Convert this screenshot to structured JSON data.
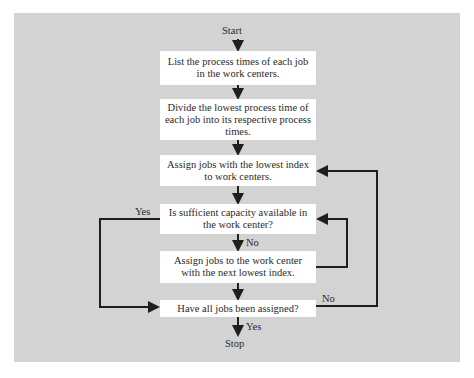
{
  "diagram": {
    "type": "flowchart",
    "terminals": {
      "start": "Start",
      "stop": "Stop"
    },
    "steps": [
      {
        "id": "list",
        "text": "List the process times of each job in the work centers.",
        "lines": [
          "List the process times of",
          "each job in the work centers."
        ]
      },
      {
        "id": "divide",
        "text": "Divide the lowest process time of each job into its respective process times.",
        "lines": [
          "Divide the lowest process",
          "time of each job into its",
          "respective process times."
        ]
      },
      {
        "id": "assign-lowest",
        "text": "Assign jobs with the lowest index to work centers.",
        "lines": [
          "Assign jobs with the lowest",
          "index to work centers."
        ]
      },
      {
        "id": "capacity-check",
        "text": "Is sufficient capacity available in the work center?",
        "lines": [
          "Is sufficient capacity",
          "available in the work center?"
        ],
        "kind": "decision"
      },
      {
        "id": "assign-next",
        "text": "Assign jobs to the work center with the next lowest index.",
        "lines": [
          "Assign jobs to the work center",
          "with the next lowest index."
        ]
      },
      {
        "id": "all-assigned",
        "text": "Have all jobs been assigned?",
        "lines": [
          "Have all jobs been assigned?"
        ],
        "kind": "decision"
      }
    ],
    "edge_labels": {
      "capacity_yes": "Yes",
      "capacity_no": "No",
      "all_assigned_no": "No",
      "all_assigned_yes": "Yes"
    },
    "edges": [
      {
        "from": "start",
        "to": "list"
      },
      {
        "from": "list",
        "to": "divide"
      },
      {
        "from": "divide",
        "to": "assign-lowest"
      },
      {
        "from": "assign-lowest",
        "to": "capacity-check"
      },
      {
        "from": "capacity-check",
        "to": "assign-next",
        "label": "No"
      },
      {
        "from": "capacity-check",
        "to": "all-assigned",
        "label": "Yes"
      },
      {
        "from": "assign-next",
        "to": "capacity-check"
      },
      {
        "from": "assign-next",
        "to": "all-assigned"
      },
      {
        "from": "all-assigned",
        "to": "assign-lowest",
        "label": "No"
      },
      {
        "from": "all-assigned",
        "to": "stop",
        "label": "Yes"
      }
    ]
  },
  "colors": {
    "background": "#d3d3d3",
    "box": "#ffffff",
    "line": "#1e1e1e"
  }
}
